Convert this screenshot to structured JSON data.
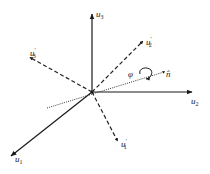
{
  "diagram": {
    "type": "3d-coordinate-rotation",
    "colors": {
      "ink": "#1a1a1a",
      "axis_dashed": "#222222",
      "dotted": "#333333"
    },
    "origin": {
      "x": 92,
      "y": 92
    },
    "axes": [
      {
        "id": "u1",
        "base": "u",
        "sub": "1",
        "prime": "",
        "style": "solid",
        "end": {
          "x": 10,
          "y": 157
        },
        "label_pos": {
          "x": 14,
          "y": 162
        }
      },
      {
        "id": "u2",
        "base": "u",
        "sub": "2",
        "prime": "",
        "style": "solid",
        "end": {
          "x": 193,
          "y": 92
        },
        "label_pos": {
          "x": 192,
          "y": 104
        }
      },
      {
        "id": "u3",
        "base": "u",
        "sub": "3",
        "prime": "",
        "style": "solid",
        "end": {
          "x": 92,
          "y": 13
        },
        "label_pos": {
          "x": 96,
          "y": 16
        }
      },
      {
        "id": "u1p",
        "base": "u",
        "sub": "1",
        "prime": "′",
        "style": "dashed",
        "end": {
          "x": 118,
          "y": 141
        },
        "label_pos": {
          "x": 121,
          "y": 148
        }
      },
      {
        "id": "u2p",
        "base": "u",
        "sub": "2",
        "prime": "′",
        "style": "dashed",
        "end": {
          "x": 143,
          "y": 41
        },
        "label_pos": {
          "x": 146,
          "y": 45
        }
      },
      {
        "id": "u3p",
        "base": "u",
        "sub": "3",
        "prime": "′",
        "style": "dashed",
        "end": {
          "x": 30,
          "y": 58
        },
        "label_pos": {
          "x": 33,
          "y": 57
        }
      }
    ],
    "rotation_axis": {
      "label": "n̂",
      "style": "dotted",
      "start": {
        "x": 47,
        "y": 108
      },
      "end": {
        "x": 164,
        "y": 72
      },
      "label_pos": {
        "x": 167,
        "y": 77
      }
    },
    "rotation_angle": {
      "label": "φ",
      "label_pos": {
        "x": 128,
        "y": 76
      }
    }
  }
}
